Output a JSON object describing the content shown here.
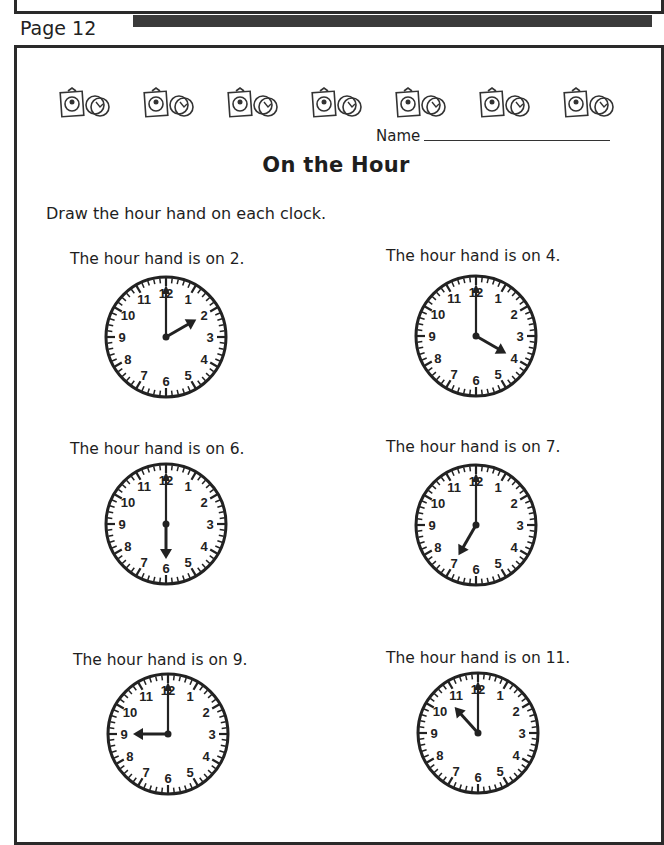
{
  "page": {
    "label": "Page 12"
  },
  "decorations": {
    "count": 7,
    "icon": "clock-gift-and-coins-icon"
  },
  "header": {
    "name_label": "Name",
    "title": "On the Hour"
  },
  "instructions": "Draw the hour hand on each clock.",
  "exercises": [
    {
      "caption": "The hour hand is on 2.",
      "hour": 2,
      "drawn_hour": 2
    },
    {
      "caption": "The hour hand is on 4.",
      "hour": 4,
      "drawn_hour": 4
    },
    {
      "caption": "The hour hand is on 6.",
      "hour": 6,
      "drawn_hour": 6
    },
    {
      "caption": "The hour hand is on 7.",
      "hour": 7,
      "drawn_hour": 7
    },
    {
      "caption": "The hour hand is on 9.",
      "hour": 9,
      "drawn_hour": 9
    },
    {
      "caption": "The hour hand is on 11.",
      "hour": 11,
      "drawn_hour": 10.6
    }
  ],
  "clock_numbers": [
    "12",
    "1",
    "2",
    "3",
    "4",
    "5",
    "6",
    "7",
    "8",
    "9",
    "10",
    "11"
  ]
}
